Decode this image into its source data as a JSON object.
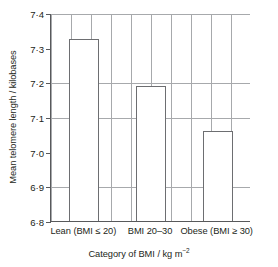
{
  "chart_data": {
    "type": "bar",
    "title": "",
    "xlabel": "Category of BMI / kg m⁻²",
    "ylabel": "Mean telomere length / kilobases",
    "categories": [
      "Lean (BMI ≤ 20)",
      "BMI 20–30",
      "Obese (BMI ≥ 30)"
    ],
    "values": [
      7.325,
      7.19,
      7.06
    ],
    "ylim": [
      6.8,
      7.4
    ],
    "ytick_labels": [
      "7·4",
      "7·3",
      "7·2",
      "7·1",
      "7·0",
      "6·9",
      "6·8"
    ],
    "ytick_values": [
      7.4,
      7.3,
      7.2,
      7.1,
      7.0,
      6.9,
      6.8
    ],
    "ytick_step": 0.1,
    "grid": "major-and-minor",
    "minor_grid_step": 0.025,
    "legend": "none",
    "bar_fill_color": "#ffffff",
    "bar_edge_color": "#6d6e71",
    "axis_color": "#58595b",
    "grid_major_color": "#a7a9ac",
    "grid_minor_color": "#d9dde0"
  },
  "axis_titles": {
    "y": "Mean telomere length / kilobases",
    "x_main": "Category of BMI / kg m",
    "x_sup": "−2"
  }
}
